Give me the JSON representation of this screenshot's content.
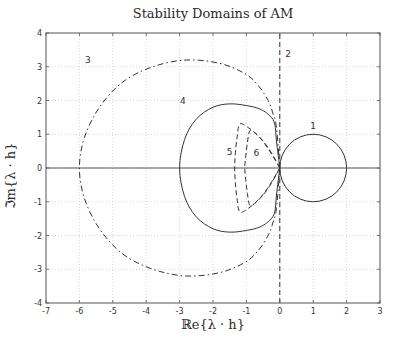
{
  "chart_data": {
    "type": "line",
    "title": "Stability Domains of AM",
    "xlabel": "ℝe{λ · h}",
    "ylabel": "ℑm{λ · h}",
    "xlim": [
      -7,
      3
    ],
    "ylim": [
      -4,
      4
    ],
    "xticks": [
      -7,
      -6,
      -5,
      -4,
      -3,
      -2,
      -1,
      0,
      1,
      2,
      3
    ],
    "yticks": [
      -4,
      -3,
      -2,
      -1,
      0,
      1,
      2,
      3,
      4
    ],
    "grid": true,
    "legend": "none (curves labeled inline 1-6)",
    "series": [
      {
        "name": "1",
        "style": "solid",
        "label_pos": [
          1.0,
          1.15
        ],
        "shape": "circle",
        "center": [
          1,
          0
        ],
        "radius": 1
      },
      {
        "name": "2",
        "style": "dashed",
        "label_pos": [
          0.25,
          3.3
        ],
        "points": [
          [
            0,
            -4
          ],
          [
            0,
            4
          ]
        ]
      },
      {
        "name": "3",
        "style": "dashdot",
        "label_pos": [
          -5.75,
          3.1
        ],
        "points": [
          [
            0,
            0
          ],
          [
            -0.1,
            1.2
          ],
          [
            -0.2,
            1.6
          ],
          [
            -0.35,
            2.0
          ],
          [
            -0.65,
            2.45
          ],
          [
            -1.05,
            2.8
          ],
          [
            -1.8,
            3.1
          ],
          [
            -2.8,
            3.2
          ],
          [
            -3.8,
            3.0
          ],
          [
            -4.7,
            2.55
          ],
          [
            -5.4,
            1.8
          ],
          [
            -5.85,
            0.9
          ],
          [
            -6.0,
            0
          ]
        ]
      },
      {
        "name": "4",
        "style": "solid",
        "label_pos": [
          -2.9,
          1.9
        ],
        "points": [
          [
            0,
            0
          ],
          [
            -0.1,
            0.8
          ],
          [
            -0.15,
            1.3
          ],
          [
            -0.3,
            1.55
          ],
          [
            -0.6,
            1.75
          ],
          [
            -1.0,
            1.85
          ],
          [
            -1.5,
            1.9
          ],
          [
            -2.0,
            1.8
          ],
          [
            -2.5,
            1.45
          ],
          [
            -2.85,
            0.85
          ],
          [
            -3.0,
            0
          ]
        ]
      },
      {
        "name": "5",
        "style": "dashed",
        "label_pos": [
          -1.5,
          0.4
        ],
        "points": [
          [
            0,
            0
          ],
          [
            -0.3,
            0.5
          ],
          [
            -0.6,
            0.9
          ],
          [
            -0.95,
            1.2
          ],
          [
            -1.2,
            1.3
          ],
          [
            -1.28,
            0.9
          ],
          [
            -1.33,
            0.45
          ],
          [
            -1.35,
            0
          ]
        ]
      },
      {
        "name": "6",
        "style": "dashed",
        "label_pos": [
          -0.7,
          0.35
        ],
        "points": [
          [
            0,
            0
          ],
          [
            -0.25,
            0.45
          ],
          [
            -0.5,
            0.8
          ],
          [
            -0.75,
            1.05
          ],
          [
            -0.9,
            1.1
          ],
          [
            -0.97,
            0.75
          ],
          [
            -1.02,
            0.35
          ],
          [
            -1.05,
            0
          ]
        ]
      }
    ],
    "symmetric_about_real_axis": true
  }
}
